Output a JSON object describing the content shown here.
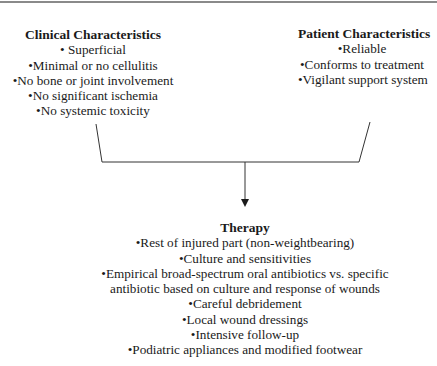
{
  "diagram": {
    "clinical": {
      "title": "Clinical Characteristics",
      "items": [
        "• Superficial",
        "•Minimal or no cellulitis",
        "•No bone or joint involvement",
        "•No significant ischemia",
        "•No systemic toxicity"
      ]
    },
    "patient": {
      "title": "Patient Characteristics",
      "items": [
        "•Reliable",
        "•Conforms to treatment",
        "•Vigilant support system"
      ]
    },
    "therapy": {
      "title": "Therapy",
      "items": [
        "•Rest of injured part (non-weightbearing)",
        "•Culture and sensitivities",
        "•Empirical broad-spectrum oral antibiotics vs. specific",
        "antibiotic based on culture and response of wounds",
        "•Careful debridement",
        "•Local wound dressings",
        "•Intensive follow-up",
        "•Podiatric appliances and modified footwear"
      ]
    },
    "colors": {
      "line": "#333333",
      "top_border": "#8a8a8a",
      "text": "#1a1a1a"
    }
  }
}
